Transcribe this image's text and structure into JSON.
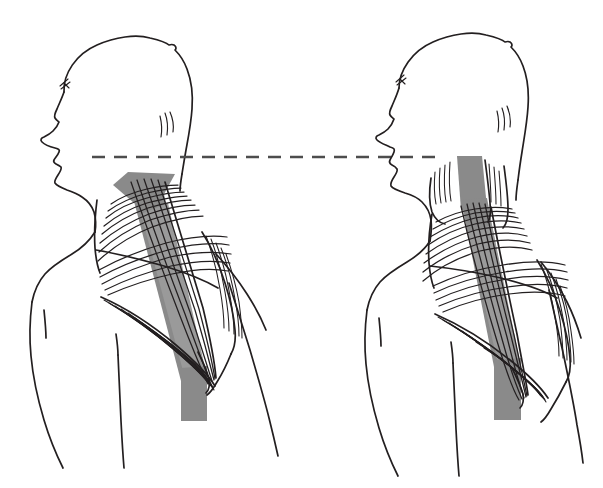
{
  "illustration": {
    "title": "Forward head posture versus neutral head posture",
    "subject": "Upper trapezius and levator scapulae muscles, posterior-lateral view",
    "background_color": "#ffffff",
    "ink_color": "#231f20",
    "highlight_band_color": "#8a8a8a",
    "reference_line_color": "#4d4d4d",
    "canvas": {
      "width": 603,
      "height": 488
    }
  },
  "reference_line": {
    "name": "horizontal-chin-reference-line",
    "style": "dashed",
    "color": "#4d4d4d",
    "stroke_width": 2.4,
    "dash_pattern": "13 9",
    "y": 157,
    "x_start": 92,
    "x_end": 441
  },
  "figures": [
    {
      "id": "left-figure",
      "label": "forward-head-posture",
      "head_tilt": "forward",
      "chin_level_y": 157,
      "highlight_band": {
        "color": "#8a8a8a",
        "description": "levator scapulae highlight band running from neck base to lower scapula",
        "top_y": 172,
        "bottom_y": 421
      }
    },
    {
      "id": "right-figure",
      "label": "neutral-head-posture",
      "head_tilt": "neutral",
      "chin_level_y": 157,
      "highlight_band": {
        "color": "#8a8a8a",
        "description": "levator scapulae highlight band running from upper neck to lower scapula",
        "top_y": 155,
        "bottom_y": 420
      }
    }
  ],
  "colors": {
    "ink": "#231f20",
    "band_gray": "#8a8a8a",
    "band_gray_light": "#9a9a9a",
    "dash_gray": "#4d4d4d",
    "paper": "#ffffff"
  }
}
